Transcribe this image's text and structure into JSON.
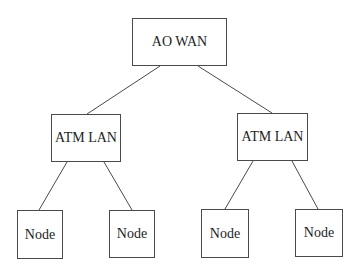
{
  "diagram": {
    "type": "tree",
    "root": {
      "label": "AO WAN",
      "box": {
        "x": 132,
        "y": 18,
        "w": 95,
        "h": 48
      }
    },
    "lans": [
      {
        "label": "ATM LAN",
        "box": {
          "x": 51,
          "y": 114,
          "w": 70,
          "h": 48
        },
        "nodes": [
          {
            "label": "Node",
            "box": {
              "x": 17,
              "y": 210,
              "w": 46,
              "h": 49
            }
          },
          {
            "label": "Node",
            "box": {
              "x": 109,
              "y": 210,
              "w": 46,
              "h": 48
            }
          }
        ]
      },
      {
        "label": "ATM LAN",
        "box": {
          "x": 237,
          "y": 113,
          "w": 71,
          "h": 48
        },
        "nodes": [
          {
            "label": "Node",
            "box": {
              "x": 201,
              "y": 209,
              "w": 48,
              "h": 49
            }
          },
          {
            "label": "Node",
            "box": {
              "x": 295,
              "y": 209,
              "w": 48,
              "h": 48
            }
          }
        ]
      }
    ],
    "edges": [
      {
        "from": "AO WAN",
        "to": "ATM LAN (left)",
        "x1": 160,
        "y1": 66,
        "x2": 87,
        "y2": 114
      },
      {
        "from": "AO WAN",
        "to": "ATM LAN (right)",
        "x1": 198,
        "y1": 66,
        "x2": 272,
        "y2": 113
      },
      {
        "from": "ATM LAN (left)",
        "to": "Node 1",
        "x1": 67,
        "y1": 162,
        "x2": 39,
        "y2": 210
      },
      {
        "from": "ATM LAN (left)",
        "to": "Node 2",
        "x1": 104,
        "y1": 162,
        "x2": 132,
        "y2": 210
      },
      {
        "from": "ATM LAN (right)",
        "to": "Node 3",
        "x1": 253,
        "y1": 161,
        "x2": 225,
        "y2": 209
      },
      {
        "from": "ATM LAN (right)",
        "to": "Node 4",
        "x1": 292,
        "y1": 161,
        "x2": 318,
        "y2": 209
      }
    ],
    "colors": {
      "line": "#4a4a4a",
      "text": "#1e1e1e",
      "background": "#ffffff"
    }
  }
}
